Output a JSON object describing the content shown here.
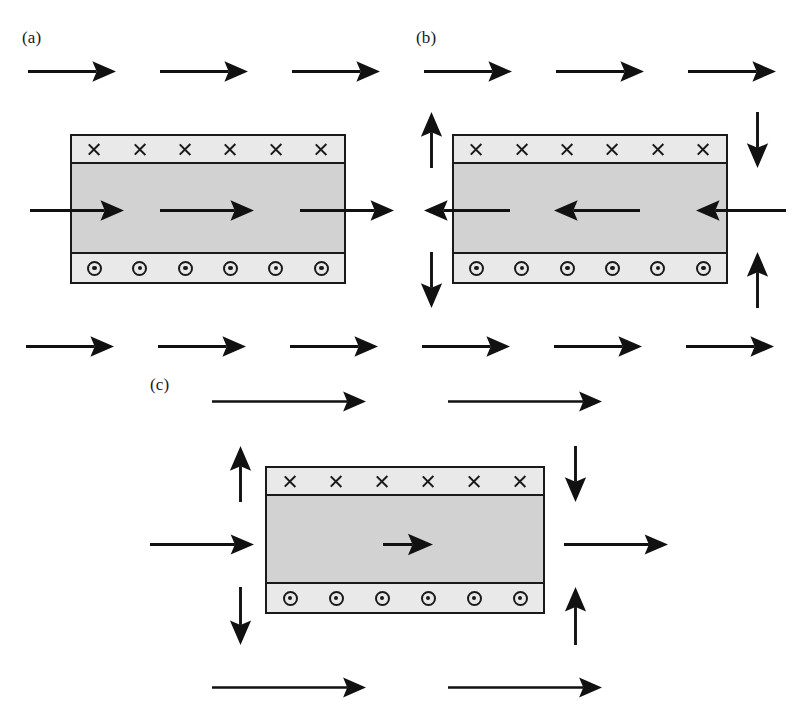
{
  "figure": {
    "width": 805,
    "height": 728,
    "background": "#ffffff",
    "ink_color": "#111111",
    "slab_core_color": "#d2d2d2",
    "slab_band_color": "#e9e9e9"
  },
  "panels": [
    {
      "id": "a",
      "label": "(a)",
      "label_x": 22,
      "label_y": 28,
      "slab": {
        "x": 70,
        "y": 134,
        "width": 276,
        "height": 150,
        "top_band_height": 28,
        "bottom_band_height": 30,
        "cross_count": 6,
        "dot_count": 6,
        "cross_symbol": "x-cross-field-into-page",
        "dot_symbol": "dot-in-circle-field-out-of-page"
      },
      "arrows": [
        {
          "name": "top-row-arrow-1",
          "dir": "right",
          "x": 28,
          "y": 68,
          "length": 82
        },
        {
          "name": "top-row-arrow-2",
          "dir": "right",
          "x": 160,
          "y": 68,
          "length": 82
        },
        {
          "name": "top-row-arrow-3",
          "dir": "right",
          "x": 292,
          "y": 68,
          "length": 82
        },
        {
          "name": "inflow-arrow",
          "dir": "right",
          "x": 30,
          "y": 207,
          "length": 88
        },
        {
          "name": "interior-arrow",
          "dir": "right",
          "x": 160,
          "y": 207,
          "length": 88
        },
        {
          "name": "outflow-arrow",
          "dir": "right",
          "x": 300,
          "y": 207,
          "length": 88
        }
      ]
    },
    {
      "id": "b",
      "label": "(b)",
      "label_x": 416,
      "label_y": 28,
      "slab": {
        "x": 452,
        "y": 134,
        "width": 276,
        "height": 150,
        "top_band_height": 28,
        "bottom_band_height": 30,
        "cross_count": 6,
        "dot_count": 6,
        "cross_symbol": "x-cross-field-into-page",
        "dot_symbol": "dot-in-circle-field-out-of-page"
      },
      "arrows": [
        {
          "name": "top-row-arrow-1",
          "dir": "right",
          "x": 424,
          "y": 68,
          "length": 82
        },
        {
          "name": "top-row-arrow-2",
          "dir": "right",
          "x": 556,
          "y": 68,
          "length": 82
        },
        {
          "name": "top-row-arrow-3",
          "dir": "right",
          "x": 688,
          "y": 68,
          "length": 82
        },
        {
          "name": "upper-left-up-arrow",
          "dir": "up",
          "x": 428,
          "y": 112,
          "length": 50
        },
        {
          "name": "upper-right-down-arrow",
          "dir": "down",
          "x": 754,
          "y": 112,
          "length": 50
        },
        {
          "name": "outflow-left-arrow",
          "dir": "left",
          "x": 424,
          "y": 207,
          "length": 80
        },
        {
          "name": "interior-left-arrow",
          "dir": "left",
          "x": 554,
          "y": 207,
          "length": 80
        },
        {
          "name": "inflow-left-arrow",
          "dir": "left",
          "x": 696,
          "y": 207,
          "length": 84
        },
        {
          "name": "lower-left-down-arrow",
          "dir": "down",
          "x": 428,
          "y": 252,
          "length": 50
        },
        {
          "name": "lower-right-up-arrow",
          "dir": "up",
          "x": 754,
          "y": 252,
          "length": 50
        }
      ]
    },
    {
      "id": "c",
      "label": "(c)",
      "label_x": 150,
      "label_y": 375,
      "slab": {
        "x": 265,
        "y": 466,
        "width": 280,
        "height": 148,
        "top_band_height": 28,
        "bottom_band_height": 30,
        "cross_count": 6,
        "dot_count": 6,
        "cross_symbol": "x-cross-field-into-page",
        "dot_symbol": "dot-in-circle-field-out-of-page"
      },
      "arrows": [
        {
          "name": "upper-row-arrow-1",
          "dir": "right",
          "x": 212,
          "y": 398,
          "length": 148
        },
        {
          "name": "upper-row-arrow-2",
          "dir": "right",
          "x": 448,
          "y": 398,
          "length": 148
        },
        {
          "name": "upper-left-up-arrow",
          "dir": "up",
          "x": 237,
          "y": 446,
          "length": 50
        },
        {
          "name": "upper-right-down-arrow",
          "dir": "down",
          "x": 572,
          "y": 446,
          "length": 50
        },
        {
          "name": "inflow-arrow",
          "dir": "right",
          "x": 150,
          "y": 541,
          "length": 98
        },
        {
          "name": "interior-arrow",
          "dir": "right",
          "x": 383,
          "y": 541,
          "length": 44
        },
        {
          "name": "outflow-arrow",
          "dir": "right",
          "x": 564,
          "y": 541,
          "length": 98
        },
        {
          "name": "lower-left-down-arrow",
          "dir": "down",
          "x": 237,
          "y": 587,
          "length": 52
        },
        {
          "name": "lower-right-up-arrow",
          "dir": "up",
          "x": 572,
          "y": 587,
          "length": 52
        },
        {
          "name": "bottom-row-arrow-1",
          "dir": "right",
          "x": 212,
          "y": 684,
          "length": 148
        },
        {
          "name": "bottom-row-arrow-2",
          "dir": "right",
          "x": 448,
          "y": 684,
          "length": 148
        }
      ]
    }
  ],
  "middle_arrow_row": {
    "name": "mid-figure-arrow-row",
    "y": 343,
    "arrows": [
      {
        "name": "mid-row-arrow-1",
        "dir": "right",
        "x": 26,
        "y": 343,
        "length": 82
      },
      {
        "name": "mid-row-arrow-2",
        "dir": "right",
        "x": 158,
        "y": 343,
        "length": 82
      },
      {
        "name": "mid-row-arrow-3",
        "dir": "right",
        "x": 290,
        "y": 343,
        "length": 82
      },
      {
        "name": "mid-row-arrow-4",
        "dir": "right",
        "x": 422,
        "y": 343,
        "length": 82
      },
      {
        "name": "mid-row-arrow-5",
        "dir": "right",
        "x": 554,
        "y": 343,
        "length": 82
      },
      {
        "name": "mid-row-arrow-6",
        "dir": "right",
        "x": 686,
        "y": 343,
        "length": 82
      }
    ]
  }
}
